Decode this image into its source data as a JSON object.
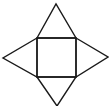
{
  "diagram": {
    "stroke_color": "#1a1a1a",
    "background": "#ffffff",
    "shapes": {
      "square": {
        "points": "37,38 76,38 76,77 37,77"
      },
      "triangle_top": {
        "points": "37,38 56,4 76,38"
      },
      "triangle_right": {
        "points": "76,38 108,57 76,77"
      },
      "triangle_bottom": {
        "points": "37,77 57,106 76,77"
      },
      "triangle_left": {
        "points": "37,38 3,58 37,77"
      }
    }
  }
}
